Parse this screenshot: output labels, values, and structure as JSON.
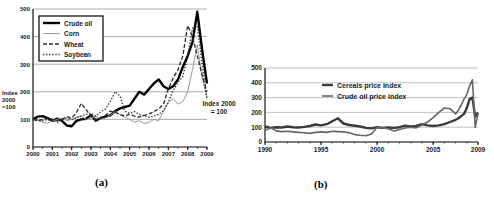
{
  "figure": {
    "background": "#ffffff",
    "captions": [
      "(a)",
      "(b)"
    ],
    "ylabels": [
      "Index\n2000\n=100",
      "Index 2000\n= 100"
    ],
    "line_colors": {
      "black": "#000000",
      "dark_gray": "#3a3a3a",
      "mid_gray": "#666666",
      "light_gray": "#999999"
    }
  },
  "chart_data": [
    {
      "type": "line",
      "title": "",
      "xlabel": "",
      "ylabel": "Index 2000 =100",
      "xlim": [
        2000,
        2009
      ],
      "ylim": [
        0,
        500
      ],
      "yticks": [
        0,
        100,
        200,
        300,
        400,
        500
      ],
      "xticks": [
        2000,
        2001,
        2002,
        2003,
        2004,
        2005,
        2006,
        2007,
        2008,
        2009
      ],
      "grid": true,
      "legend_position": "top-left-boxed",
      "x": [
        2000,
        2000.25,
        2000.5,
        2000.75,
        2001,
        2001.25,
        2001.5,
        2001.75,
        2002,
        2002.25,
        2002.5,
        2002.75,
        2003,
        2003.25,
        2003.5,
        2003.75,
        2004,
        2004.25,
        2004.5,
        2004.75,
        2005,
        2005.25,
        2005.5,
        2005.75,
        2006,
        2006.25,
        2006.5,
        2006.75,
        2007,
        2007.25,
        2007.5,
        2007.75,
        2008,
        2008.25,
        2008.5,
        2008.75,
        2009
      ],
      "series": [
        {
          "name": "Crude oil",
          "color": "#000000",
          "width": 2.4,
          "dash": "",
          "values": [
            100,
            110,
            112,
            105,
            95,
            103,
            95,
            78,
            75,
            95,
            100,
            102,
            115,
            95,
            105,
            110,
            115,
            130,
            140,
            145,
            150,
            175,
            200,
            190,
            210,
            230,
            245,
            220,
            210,
            220,
            245,
            290,
            330,
            380,
            490,
            350,
            230
          ]
        },
        {
          "name": "Corn",
          "color": "#999999",
          "width": 1,
          "dash": "",
          "values": [
            100,
            95,
            90,
            85,
            95,
            100,
            105,
            95,
            100,
            108,
            112,
            100,
            105,
            112,
            100,
            105,
            115,
            128,
            118,
            108,
            100,
            90,
            95,
            85,
            90,
            100,
            95,
            130,
            160,
            175,
            155,
            165,
            200,
            280,
            370,
            250,
            180
          ]
        },
        {
          "name": "Wheat",
          "color": "#2a2a2a",
          "width": 1.3,
          "dash": "4,2",
          "values": [
            100,
            95,
            100,
            105,
            100,
            95,
            100,
            110,
            105,
            125,
            158,
            135,
            110,
            100,
            105,
            115,
            130,
            125,
            118,
            112,
            118,
            112,
            108,
            115,
            120,
            128,
            138,
            155,
            210,
            250,
            280,
            330,
            440,
            400,
            330,
            260,
            200
          ]
        },
        {
          "name": "Soybean",
          "color": "#2a2a2a",
          "width": 1.4,
          "dash": "1.3,1.8",
          "values": [
            100,
            98,
            95,
            100,
            95,
            90,
            100,
            105,
            100,
            105,
            112,
            118,
            122,
            112,
            128,
            138,
            165,
            200,
            185,
            130,
            122,
            128,
            118,
            112,
            108,
            112,
            118,
            132,
            162,
            205,
            235,
            255,
            330,
            430,
            440,
            300,
            170
          ]
        }
      ]
    },
    {
      "type": "line",
      "title": "",
      "xlabel": "",
      "ylabel": "Index 2000 = 100",
      "xlim": [
        1990,
        2009
      ],
      "ylim": [
        0,
        500
      ],
      "yticks": [
        0,
        100,
        200,
        300,
        400,
        500
      ],
      "xticks": [
        1990,
        1995,
        2000,
        2005,
        2009
      ],
      "grid": true,
      "legend_position": "top-center",
      "x": [
        1990,
        1990.5,
        1991,
        1991.5,
        1992,
        1992.5,
        1993,
        1993.5,
        1994,
        1994.5,
        1995,
        1995.5,
        1996,
        1996.5,
        1997,
        1997.5,
        1998,
        1998.5,
        1999,
        1999.5,
        2000,
        2000.5,
        2001,
        2001.5,
        2002,
        2002.5,
        2003,
        2003.5,
        2004,
        2004.5,
        2005,
        2005.5,
        2006,
        2006.5,
        2007,
        2007.25,
        2007.5,
        2007.75,
        2008,
        2008.25,
        2008.5,
        2008.75,
        2009
      ],
      "series": [
        {
          "name": "Cereals price index",
          "color": "#3a3a3a",
          "width": 2.4,
          "dash": "",
          "values": [
            105,
            95,
            100,
            98,
            105,
            100,
            98,
            102,
            108,
            118,
            112,
            120,
            140,
            160,
            125,
            115,
            110,
            105,
            95,
            92,
            100,
            95,
            98,
            95,
            100,
            110,
            105,
            108,
            120,
            112,
            108,
            112,
            120,
            135,
            150,
            160,
            175,
            190,
            230,
            290,
            300,
            170,
            200
          ]
        },
        {
          "name": "Crude oil price index",
          "color": "#666666",
          "width": 1.6,
          "dash": "",
          "values": [
            80,
            95,
            75,
            70,
            72,
            68,
            65,
            62,
            58,
            65,
            68,
            65,
            72,
            70,
            68,
            62,
            50,
            45,
            42,
            55,
            100,
            95,
            90,
            75,
            85,
            95,
            100,
            95,
            115,
            135,
            165,
            200,
            230,
            225,
            190,
            215,
            250,
            290,
            320,
            380,
            420,
            100,
            190
          ]
        }
      ]
    }
  ]
}
